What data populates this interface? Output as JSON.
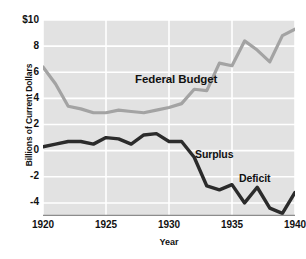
{
  "chart_data": {
    "type": "line",
    "title": "",
    "xlabel": "Year",
    "ylabel": "Billions of Current Dollars",
    "xlim": [
      1920,
      1940
    ],
    "ylim": [
      -5,
      10
    ],
    "grid": true,
    "legend": "none",
    "xticks": [
      1920,
      1925,
      1930,
      1935,
      1940
    ],
    "xtick_labels": [
      "1920",
      "1925",
      "1930",
      "1935",
      "1940"
    ],
    "yticks": [
      10,
      8,
      6,
      4,
      2,
      0,
      -2,
      -4
    ],
    "ytick_labels": [
      "$10",
      "8",
      "6",
      "4",
      "2",
      "0",
      "-2",
      "-4"
    ],
    "x": [
      1920,
      1921,
      1922,
      1923,
      1924,
      1925,
      1926,
      1927,
      1928,
      1929,
      1930,
      1931,
      1932,
      1933,
      1934,
      1935,
      1936,
      1937,
      1938,
      1939,
      1940
    ],
    "series": [
      {
        "name": "Federal Budget",
        "color": "#a3a3a3",
        "values": [
          6.4,
          5.1,
          3.4,
          3.2,
          2.9,
          2.9,
          3.1,
          3.0,
          2.9,
          3.1,
          3.3,
          3.6,
          4.7,
          4.6,
          6.7,
          6.5,
          8.4,
          7.7,
          6.8,
          8.8,
          9.3
        ]
      },
      {
        "name": "Surplus / Deficit",
        "color": "#2b2b2b",
        "values": [
          0.3,
          0.5,
          0.7,
          0.7,
          0.5,
          1.0,
          0.9,
          0.5,
          1.2,
          1.3,
          0.7,
          0.7,
          -0.5,
          -2.7,
          -3.0,
          -2.6,
          -4.0,
          -2.8,
          -4.4,
          -4.8,
          -3.2
        ]
      }
    ],
    "annotations": [
      {
        "text": "Federal Budget",
        "x": 1927.5,
        "y": 7.3
      },
      {
        "text": "Surplus",
        "x": 1932.5,
        "y": 1.5
      },
      {
        "text": "Deficit",
        "x": 1936.0,
        "y": -0.3
      }
    ]
  }
}
